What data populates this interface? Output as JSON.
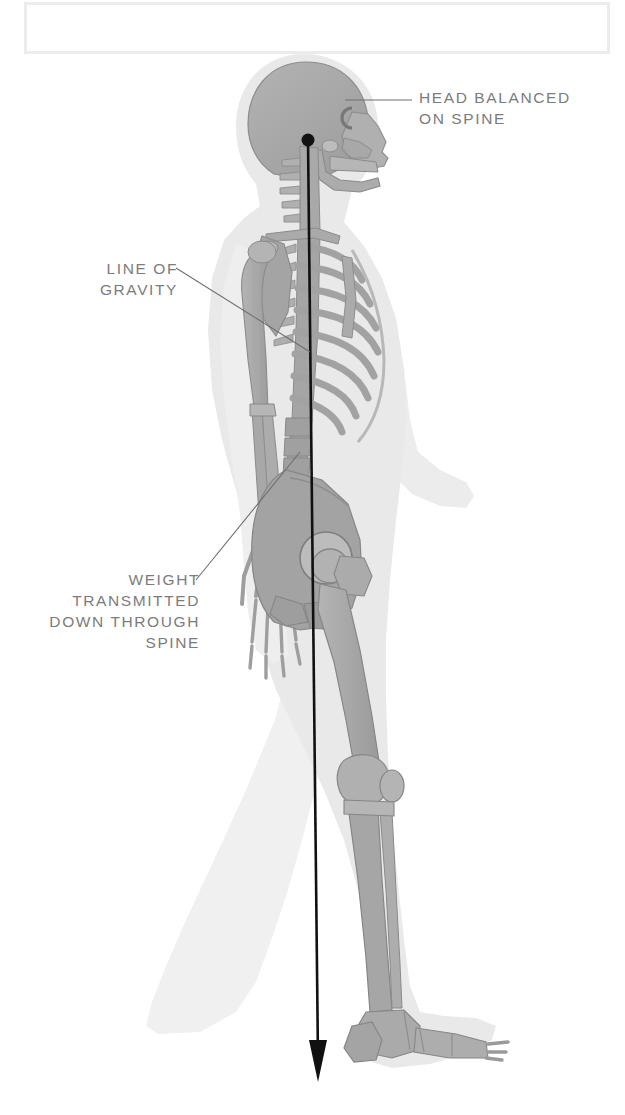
{
  "page": {
    "background_color": "#ffffff",
    "width": 625,
    "height": 1115
  },
  "frame": {
    "name": "top-border-box",
    "border_color": "#ececec"
  },
  "palette": {
    "bone": "#a9a9a9",
    "bone_outline": "#8f8f8f",
    "body_silhouette": "#e9e9e9",
    "body_silhouette_back": "#f1f1f1",
    "line_of_gravity": "#111111",
    "label_text": "#7c7c7c",
    "leader_line": "#6e6e6e"
  },
  "callouts": [
    {
      "id": "head-balanced",
      "text": "HEAD BALANCED\nON SPINE",
      "align": "left",
      "leader": "horizontal line from skull to text"
    },
    {
      "id": "line-of-gravity",
      "text": "LINE OF\nGRAVITY",
      "align": "right",
      "leader": "diagonal line down-right to vertical plumb line"
    },
    {
      "id": "weight-transmitted",
      "text": "WEIGHT\nTRANSMITTED\nDOWN THROUGH\nSPINE",
      "align": "right",
      "leader": "diagonal line up-right to lumbar spine"
    }
  ],
  "annotations": {
    "plumb_line": {
      "name": "line-of-gravity",
      "origin_marker": "filled circle at skull base / atlanto-occipital joint",
      "direction": "vertical downward",
      "terminator": "arrowhead"
    }
  },
  "figure": {
    "view": "lateral (side) view, walking stride",
    "facing": "right",
    "structures": [
      "skull",
      "mandible",
      "cervical vertebrae",
      "thoracic vertebrae",
      "lumbar vertebrae",
      "sacrum",
      "clavicle",
      "scapula",
      "ribcage",
      "sternum",
      "humerus",
      "radius",
      "ulna",
      "carpals",
      "metacarpals",
      "phalanges",
      "pelvis / ilium",
      "femur",
      "patella",
      "tibia",
      "fibula",
      "tarsals",
      "metatarsals",
      "toe phalanges"
    ]
  }
}
